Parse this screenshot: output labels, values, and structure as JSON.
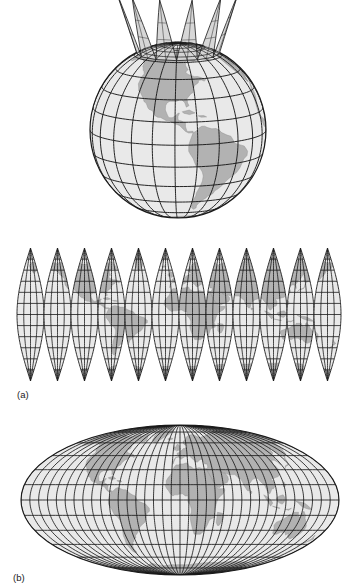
{
  "figure": {
    "caption_a": "(a)",
    "caption_b": "(b)",
    "panels": [
      {
        "id": "globe-with-gores",
        "name": "globe-with-peeling-gores",
        "description": "Three-dimensional shaded globe centred on the Americas with a latitude-longitude graticule; twelve gore strips peel upward and away from the north pole."
      },
      {
        "id": "flat-gores",
        "name": "interrupted-globe-gores",
        "description": "Twelve flattened sinusoidal globe gores laid side by side forming an interrupted world map.",
        "gore_count": 12
      },
      {
        "id": "mollweide",
        "name": "mollweide-elliptical-projection",
        "description": "Elliptical equal-area world projection centred on the prime meridian with curved meridians and straight parallels."
      }
    ]
  },
  "chart_data": {
    "type": "map",
    "title": "",
    "projections": [
      {
        "panel": "a-top",
        "name": "globe (orthographic) with interrupted gores",
        "center_lon": -90,
        "center_lat": 12,
        "graticule_step_lat": 15,
        "graticule_step_lon": 15,
        "gore_count": 12,
        "gore_width_deg": 30
      },
      {
        "panel": "a-bottom",
        "name": "interrupted sinusoidal gores",
        "gore_count": 12,
        "gore_width_deg": 30,
        "lat_range": [
          -90,
          90
        ],
        "graticule_step_lat": 15,
        "graticule_step_lon": 15,
        "center_lon_first_gore": -165
      },
      {
        "panel": "b",
        "name": "Mollweide",
        "center_lon": 0,
        "lat_range": [
          -90,
          90
        ],
        "lon_range": [
          -180,
          180
        ],
        "graticule_step_lat": 15,
        "graticule_step_lon": 10
      }
    ],
    "colors": {
      "land_fill": "#b2b2b2",
      "ocean_fill": "#e9e9e9",
      "graticule_stroke": "#1a1a1a",
      "coastline_stroke": "#8a8a8a",
      "outline_stroke": "#1a1a1a",
      "background": "#ffffff",
      "label_text": "#1a1a1a"
    },
    "geography_regions": [
      "North America",
      "South America",
      "Greenland",
      "Europe",
      "Africa",
      "Asia",
      "Australia",
      "Antarctica-edge",
      "Indonesia",
      "Japan",
      "Madagascar",
      "British Isles"
    ]
  }
}
